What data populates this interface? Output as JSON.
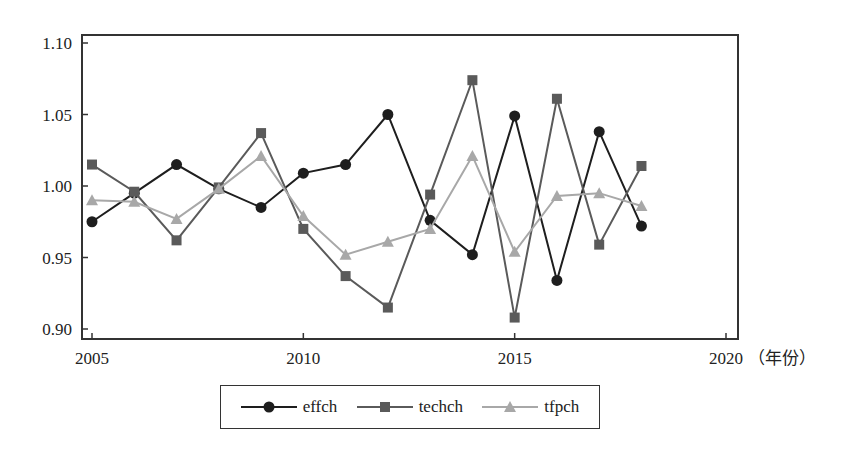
{
  "chart_data": {
    "type": "line",
    "title": "",
    "xlabel": "（年份）",
    "ylabel": "",
    "x": [
      2005,
      2006,
      2007,
      2008,
      2009,
      2010,
      2011,
      2012,
      2013,
      2014,
      2015,
      2016,
      2017,
      2018
    ],
    "xlim": [
      2005,
      2020
    ],
    "ylim": [
      0.9,
      1.1
    ],
    "x_ticks": [
      "2005",
      "2010",
      "2015",
      "2020"
    ],
    "y_ticks": [
      "1.10",
      "1.05",
      "1.00",
      "0.95",
      "0.90"
    ],
    "grid": false,
    "legend_position": "bottom-center",
    "series": [
      {
        "name": "effch",
        "marker": "circle",
        "color": "#1e1e1e",
        "values": [
          0.975,
          0.995,
          1.015,
          0.998,
          0.985,
          1.009,
          1.015,
          1.05,
          0.976,
          0.952,
          1.049,
          0.934,
          1.038,
          0.972
        ]
      },
      {
        "name": "techch",
        "marker": "square",
        "color": "#5a5a5a",
        "values": [
          1.015,
          0.996,
          0.962,
          0.999,
          1.037,
          0.97,
          0.937,
          0.915,
          0.994,
          1.074,
          0.908,
          1.061,
          0.959,
          1.014
        ]
      },
      {
        "name": "tfpch",
        "marker": "triangle",
        "color": "#a8a8a8",
        "values": [
          0.99,
          0.989,
          0.977,
          0.998,
          1.021,
          0.979,
          0.952,
          0.961,
          0.97,
          1.021,
          0.954,
          0.993,
          0.995,
          0.986
        ]
      }
    ]
  },
  "axis": {
    "x_unit_label": "（年份）",
    "last_x_tick": "2020"
  },
  "legend": {
    "items": [
      {
        "label": "effch"
      },
      {
        "label": "techch"
      },
      {
        "label": "tfpch"
      }
    ]
  }
}
